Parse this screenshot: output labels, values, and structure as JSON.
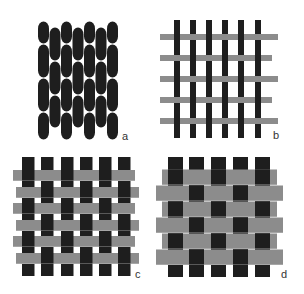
{
  "figure": {
    "colors": {
      "warp": "#1e1e1e",
      "weft": "#8c8c8c",
      "background": "#ffffff"
    },
    "panels": [
      {
        "id": "a",
        "label": "a",
        "type": "packed-yarns",
        "label_pos": [
          122,
          140
        ],
        "columns": [
          {
            "x": 38,
            "top": 21,
            "segments": [
              21,
              44,
              78,
              112,
              140
            ]
          },
          {
            "x": 49.5,
            "top": 27,
            "segments": [
              27,
              61,
              95,
              128
            ]
          },
          {
            "x": 61,
            "top": 21,
            "segments": [
              21,
              44,
              78,
              112,
              140
            ]
          },
          {
            "x": 72.5,
            "top": 27,
            "segments": [
              27,
              61,
              95,
              128
            ]
          },
          {
            "x": 84,
            "top": 21,
            "segments": [
              21,
              44,
              78,
              112,
              140
            ]
          },
          {
            "x": 95.5,
            "top": 27,
            "segments": [
              27,
              61,
              95,
              128
            ]
          },
          {
            "x": 107,
            "top": 21,
            "segments": [
              21,
              44,
              78,
              112,
              140
            ]
          }
        ],
        "column_width": 11
      },
      {
        "id": "b",
        "label": "b",
        "type": "open-weave",
        "label_pos": [
          273,
          139
        ],
        "warp": {
          "xs": [
            174,
            190,
            206,
            222,
            238,
            255
          ],
          "width": 6,
          "top": 20,
          "bottom": 138
        },
        "weft": [
          {
            "y": 34,
            "x1": 160,
            "x2": 278
          },
          {
            "y": 55,
            "x1": 160,
            "x2": 272
          },
          {
            "y": 76,
            "x1": 160,
            "x2": 278
          },
          {
            "y": 97,
            "x1": 160,
            "x2": 272
          },
          {
            "y": 118,
            "x1": 160,
            "x2": 278
          }
        ],
        "weft_height": 6
      },
      {
        "id": "c",
        "label": "c",
        "type": "medium-weave",
        "label_pos": [
          135,
          278
        ],
        "warp": {
          "xs": [
            22,
            41,
            61,
            80,
            99,
            118
          ],
          "width": 12.5,
          "top": 157,
          "bottom": 276
        },
        "weft": [
          {
            "y": 170,
            "x1": 13,
            "x2": 135
          },
          {
            "y": 187,
            "x1": 16,
            "x2": 139
          },
          {
            "y": 203,
            "x1": 13,
            "x2": 135
          },
          {
            "y": 220,
            "x1": 16,
            "x2": 139
          },
          {
            "y": 236,
            "x1": 13,
            "x2": 135
          },
          {
            "y": 253,
            "x1": 16,
            "x2": 139
          }
        ],
        "weft_height": 11
      },
      {
        "id": "d",
        "label": "d",
        "type": "dense-weave",
        "label_pos": [
          281,
          278
        ],
        "warp": {
          "xs": [
            168,
            189,
            211,
            233,
            255
          ],
          "width": 15,
          "top": 157,
          "bottom": 277
        },
        "weft": [
          {
            "y": 169.5,
            "x1": 162,
            "x2": 277
          },
          {
            "y": 185.5,
            "x1": 156,
            "x2": 283
          },
          {
            "y": 201.5,
            "x1": 162,
            "x2": 277
          },
          {
            "y": 217.5,
            "x1": 156,
            "x2": 283
          },
          {
            "y": 233.5,
            "x1": 162,
            "x2": 277
          },
          {
            "y": 249.5,
            "x1": 156,
            "x2": 283
          }
        ],
        "weft_height": 15.5
      }
    ]
  }
}
